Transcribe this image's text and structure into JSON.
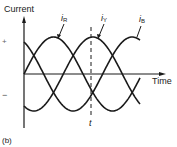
{
  "figure": {
    "panel_label": "(b)",
    "y_axis_label": "Current",
    "x_axis_label": "Time",
    "positive_sign": "+",
    "negative_sign": "−",
    "time_marker_label": "t",
    "series": [
      {
        "name": "i",
        "subscript": "R",
        "phase_deg": 0
      },
      {
        "name": "i",
        "subscript": "Y",
        "phase_deg": -120
      },
      {
        "name": "i",
        "subscript": "B",
        "phase_deg": -240
      }
    ],
    "colors": {
      "line": "#1a1a1a",
      "background": "#ffffff"
    }
  }
}
